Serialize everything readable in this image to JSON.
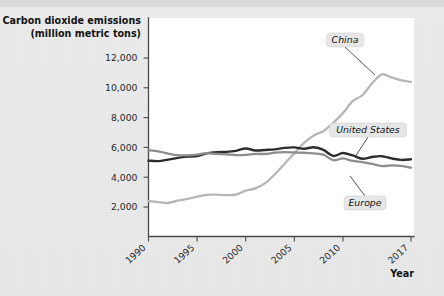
{
  "chart_data": {
    "type": "line",
    "title": "Carbon dioxide emissions (million metric tons)",
    "ylabel_line1": "Carbon dioxide emissions",
    "ylabel_line2": "(million metric tons)",
    "xlabel": "Year",
    "xlim": [
      1990,
      2017
    ],
    "ylim": [
      0,
      13000
    ],
    "ytick_labels": [
      "12,000",
      "10,000",
      "8,000",
      "6,000",
      "4,000",
      "2,000"
    ],
    "yticks": [
      12000,
      10000,
      8000,
      6000,
      4000,
      2000
    ],
    "xtick_labels": [
      "1990",
      "1995",
      "2000",
      "2005",
      "2010",
      "2017"
    ],
    "xticks": [
      1990,
      1995,
      2000,
      2005,
      2010,
      2017
    ],
    "grid": false,
    "legend_position": "inline-callouts",
    "x": [
      1990,
      1991,
      1992,
      1993,
      1994,
      1995,
      1996,
      1997,
      1998,
      1999,
      2000,
      2001,
      2002,
      2003,
      2004,
      2005,
      2006,
      2007,
      2008,
      2009,
      2010,
      2011,
      2012,
      2013,
      2014,
      2015,
      2016,
      2017
    ],
    "series": [
      {
        "name": "China",
        "color": "#b6b6b6",
        "width": 2.3,
        "values": [
          2400,
          2330,
          2270,
          2420,
          2540,
          2700,
          2820,
          2830,
          2800,
          2830,
          3100,
          3250,
          3600,
          4200,
          4900,
          5600,
          6300,
          6800,
          7100,
          7650,
          8300,
          9100,
          9500,
          10300,
          10900,
          10700,
          10500,
          10400
        ]
      },
      {
        "name": "United States",
        "color": "#2d2d2d",
        "width": 2.4,
        "values": [
          5110,
          5080,
          5180,
          5300,
          5380,
          5420,
          5600,
          5680,
          5700,
          5770,
          5930,
          5790,
          5830,
          5870,
          5970,
          6000,
          5910,
          6010,
          5830,
          5430,
          5620,
          5460,
          5240,
          5360,
          5410,
          5260,
          5160,
          5200
        ]
      },
      {
        "name": "Europe",
        "color": "#8d8d8d",
        "width": 2.3,
        "values": [
          5810,
          5740,
          5590,
          5480,
          5470,
          5520,
          5610,
          5560,
          5540,
          5480,
          5500,
          5560,
          5560,
          5650,
          5680,
          5660,
          5640,
          5600,
          5510,
          5140,
          5260,
          5090,
          5010,
          4890,
          4750,
          4790,
          4760,
          4640
        ]
      }
    ],
    "annotations": [
      {
        "label": "China",
        "box_x": 345,
        "box_y": 40,
        "point_x": 375,
        "point_y": 75
      },
      {
        "label": "United States",
        "box_x": 368,
        "box_y": 130,
        "point_x": 355,
        "point_y": 157
      },
      {
        "label": "Europe",
        "box_x": 365,
        "box_y": 203,
        "point_x": 350,
        "point_y": 176
      }
    ]
  }
}
